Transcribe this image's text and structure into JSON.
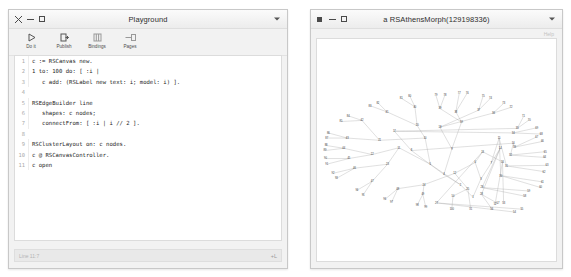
{
  "playground": {
    "title": "Playground",
    "window_buttons": [
      "close",
      "minimize",
      "maximize"
    ],
    "menu_icon": "chevron-down-icon",
    "toolbar": [
      {
        "label": "Do it",
        "icon": "play-icon"
      },
      {
        "label": "Publish",
        "icon": "publish-icon"
      },
      {
        "label": "Bindings",
        "icon": "bindings-icon"
      },
      {
        "label": "Pages",
        "icon": "pages-icon"
      }
    ],
    "code_lines": [
      {
        "n": "1",
        "text": "c := RSCanvas new."
      },
      {
        "n": "2",
        "text": "1 to: 100 do: [ :i |"
      },
      {
        "n": "3",
        "text": "   c add: (RSLabel new text: i; model: i) ]."
      },
      {
        "n": "4",
        "text": ""
      },
      {
        "n": "5",
        "text": "RSEdgeBuilder line"
      },
      {
        "n": "6",
        "text": "   shapes: c nodes;"
      },
      {
        "n": "7",
        "text": "   connectFrom: [ :i | i // 2 ]."
      },
      {
        "n": "8",
        "text": ""
      },
      {
        "n": "9",
        "text": "RSClusterLayout on: c nodes."
      },
      {
        "n": "10",
        "text": "c @ RSCanvasController."
      },
      {
        "n": "11",
        "text": "c open"
      }
    ],
    "status": {
      "left": "Line 11:7",
      "right": "+L"
    }
  },
  "morph": {
    "title": "a RSAthensMorph(129198336)",
    "window_buttons": [
      "square",
      "minimize",
      "maximize"
    ],
    "menu_icon": "chevron-down-icon",
    "help_label": "Help"
  },
  "colors": {
    "window_bg": "#f2f2f2",
    "canvas_bg": "#ffffff",
    "edge": "#9b9b9b",
    "label": "#3a3a3a",
    "border": "#c8c8c8"
  },
  "chart_data": {
    "type": "tree",
    "node_count": 100,
    "edge_rule": "parent(i) = i // 2",
    "root": 1,
    "nodes": [
      {
        "id": "1",
        "x": 274,
        "y": 208
      },
      {
        "id": "2",
        "x": 252,
        "y": 186
      },
      {
        "id": "3",
        "x": 288,
        "y": 176
      },
      {
        "id": "4",
        "x": 223,
        "y": 168
      },
      {
        "id": "5",
        "x": 199,
        "y": 150
      },
      {
        "id": "6",
        "x": 278,
        "y": 147
      },
      {
        "id": "7",
        "x": 306,
        "y": 148
      },
      {
        "id": "8",
        "x": 166,
        "y": 126
      },
      {
        "id": "9",
        "x": 237,
        "y": 123
      },
      {
        "id": "10",
        "x": 190,
        "y": 104
      },
      {
        "id": "11",
        "x": 144,
        "y": 121
      },
      {
        "id": "12",
        "x": 242,
        "y": 166
      },
      {
        "id": "13",
        "x": 291,
        "y": 128
      },
      {
        "id": "14",
        "x": 322,
        "y": 122
      },
      {
        "id": "15",
        "x": 320,
        "y": 104
      },
      {
        "id": "16",
        "x": 345,
        "y": 113
      },
      {
        "id": "17",
        "x": 136,
        "y": 92
      },
      {
        "id": "18",
        "x": 216,
        "y": 85
      },
      {
        "id": "19",
        "x": 254,
        "y": 76
      },
      {
        "id": "20",
        "x": 176,
        "y": 82
      },
      {
        "id": "21",
        "x": 110,
        "y": 108
      },
      {
        "id": "22",
        "x": 97,
        "y": 133
      },
      {
        "id": "23",
        "x": 124,
        "y": 150
      },
      {
        "id": "24",
        "x": 188,
        "y": 186
      },
      {
        "id": "25",
        "x": 265,
        "y": 193
      },
      {
        "id": "26",
        "x": 326,
        "y": 146
      },
      {
        "id": "27",
        "x": 210,
        "y": 218
      },
      {
        "id": "28",
        "x": 289,
        "y": 203
      },
      {
        "id": "29",
        "x": 290,
        "y": 191
      },
      {
        "id": "30",
        "x": 323,
        "y": 170
      },
      {
        "id": "31",
        "x": 333,
        "y": 153
      },
      {
        "id": "32",
        "x": 340,
        "y": 134
      },
      {
        "id": "33",
        "x": 347,
        "y": 120
      },
      {
        "id": "34",
        "x": 345,
        "y": 95
      },
      {
        "id": "35",
        "x": 352,
        "y": 87
      },
      {
        "id": "36",
        "x": 310,
        "y": 60
      },
      {
        "id": "37",
        "x": 284,
        "y": 55
      },
      {
        "id": "38",
        "x": 244,
        "y": 58
      },
      {
        "id": "39",
        "x": 216,
        "y": 52
      },
      {
        "id": "40",
        "x": 172,
        "y": 49
      },
      {
        "id": "41",
        "x": 123,
        "y": 58
      },
      {
        "id": "42",
        "x": 79,
        "y": 73
      },
      {
        "id": "43",
        "x": 53,
        "y": 104
      },
      {
        "id": "44",
        "x": 47,
        "y": 122
      },
      {
        "id": "45",
        "x": 56,
        "y": 140
      },
      {
        "id": "46",
        "x": 66,
        "y": 157
      },
      {
        "id": "47",
        "x": 97,
        "y": 180
      },
      {
        "id": "48",
        "x": 142,
        "y": 193
      },
      {
        "id": "49",
        "x": 186,
        "y": 203
      },
      {
        "id": "50",
        "x": 239,
        "y": 206
      },
      {
        "id": "51",
        "x": 270,
        "y": 228
      },
      {
        "id": "52",
        "x": 313,
        "y": 220
      },
      {
        "id": "53",
        "x": 328,
        "y": 219
      },
      {
        "id": "54",
        "x": 347,
        "y": 234
      },
      {
        "id": "55",
        "x": 360,
        "y": 229
      },
      {
        "id": "56",
        "x": 307,
        "y": 228
      },
      {
        "id": "57",
        "x": 318,
        "y": 219
      },
      {
        "id": "58",
        "x": 365,
        "y": 206
      },
      {
        "id": "59",
        "x": 372,
        "y": 197
      },
      {
        "id": "60",
        "x": 393,
        "y": 191
      },
      {
        "id": "61",
        "x": 396,
        "y": 181
      },
      {
        "id": "62",
        "x": 399,
        "y": 163
      },
      {
        "id": "63",
        "x": 404,
        "y": 152
      },
      {
        "id": "64",
        "x": 400,
        "y": 138
      },
      {
        "id": "65",
        "x": 401,
        "y": 128
      },
      {
        "id": "66",
        "x": 396,
        "y": 110
      },
      {
        "id": "67",
        "x": 386,
        "y": 102
      },
      {
        "id": "68",
        "x": 394,
        "y": 97
      },
      {
        "id": "69",
        "x": 386,
        "y": 86
      },
      {
        "id": "70",
        "x": 373,
        "y": 72
      },
      {
        "id": "71",
        "x": 363,
        "y": 66
      },
      {
        "id": "72",
        "x": 341,
        "y": 50
      },
      {
        "id": "73",
        "x": 328,
        "y": 43
      },
      {
        "id": "74",
        "x": 305,
        "y": 34
      },
      {
        "id": "75",
        "x": 292,
        "y": 30
      },
      {
        "id": "76",
        "x": 264,
        "y": 25
      },
      {
        "id": "77",
        "x": 250,
        "y": 25
      },
      {
        "id": "78",
        "x": 225,
        "y": 28
      },
      {
        "id": "79",
        "x": 209,
        "y": 29
      },
      {
        "id": "80",
        "x": 163,
        "y": 30
      },
      {
        "id": "81",
        "x": 148,
        "y": 34
      },
      {
        "id": "82",
        "x": 107,
        "y": 42
      },
      {
        "id": "83",
        "x": 93,
        "y": 47
      },
      {
        "id": "84",
        "x": 55,
        "y": 65
      },
      {
        "id": "85",
        "x": 42,
        "y": 75
      },
      {
        "id": "86",
        "x": 20,
        "y": 95
      },
      {
        "id": "87",
        "x": 17,
        "y": 104
      },
      {
        "id": "88",
        "x": 16,
        "y": 117
      },
      {
        "id": "89",
        "x": 14,
        "y": 126
      },
      {
        "id": "90",
        "x": 15,
        "y": 140
      },
      {
        "id": "91",
        "x": 17,
        "y": 150
      },
      {
        "id": "92",
        "x": 28,
        "y": 166
      },
      {
        "id": "93",
        "x": 34,
        "y": 175
      },
      {
        "id": "94",
        "x": 70,
        "y": 196
      },
      {
        "id": "95",
        "x": 81,
        "y": 204
      },
      {
        "id": "96",
        "x": 119,
        "y": 212
      },
      {
        "id": "97",
        "x": 131,
        "y": 217
      },
      {
        "id": "98",
        "x": 176,
        "y": 222
      },
      {
        "id": "99",
        "x": 191,
        "y": 225
      },
      {
        "id": "100",
        "x": 237,
        "y": 228
      }
    ]
  }
}
